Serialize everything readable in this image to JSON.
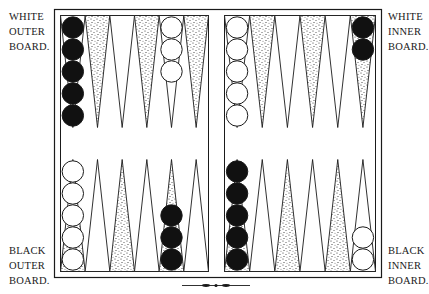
{
  "labels": {
    "white_outer": [
      "WHITE",
      "OUTER",
      "BOARD."
    ],
    "white_inner": [
      "WHITE",
      "INNER",
      "BOARD."
    ],
    "black_outer": [
      "BLACK",
      "OUTER",
      "BOARD."
    ],
    "black_inner": [
      "BLACK",
      "INNER",
      "BOARD."
    ]
  },
  "colors": {
    "line": "#1a1a1a",
    "black_checker": "#111111",
    "white_checker": "#ffffff",
    "stipple": "#2a2a2a",
    "background": "#ffffff"
  },
  "board": {
    "quadrants": {
      "top_left": [
        {
          "stippled": false,
          "checkers": {
            "color": "black",
            "count": 5
          }
        },
        {
          "stippled": true,
          "checkers": null
        },
        {
          "stippled": false,
          "checkers": null
        },
        {
          "stippled": true,
          "checkers": null
        },
        {
          "stippled": false,
          "checkers": {
            "color": "white",
            "count": 3
          }
        },
        {
          "stippled": true,
          "checkers": null
        }
      ],
      "top_right": [
        {
          "stippled": false,
          "checkers": {
            "color": "white",
            "count": 5
          }
        },
        {
          "stippled": true,
          "checkers": null
        },
        {
          "stippled": false,
          "checkers": null
        },
        {
          "stippled": true,
          "checkers": null
        },
        {
          "stippled": false,
          "checkers": null
        },
        {
          "stippled": true,
          "checkers": {
            "color": "black",
            "count": 2
          }
        }
      ],
      "bottom_left": [
        {
          "stippled": true,
          "checkers": {
            "color": "white",
            "count": 5
          }
        },
        {
          "stippled": false,
          "checkers": null
        },
        {
          "stippled": true,
          "checkers": null
        },
        {
          "stippled": false,
          "checkers": null
        },
        {
          "stippled": true,
          "checkers": {
            "color": "black",
            "count": 3
          }
        },
        {
          "stippled": false,
          "checkers": null
        }
      ],
      "bottom_right": [
        {
          "stippled": true,
          "checkers": {
            "color": "black",
            "count": 5
          }
        },
        {
          "stippled": false,
          "checkers": null
        },
        {
          "stippled": true,
          "checkers": null
        },
        {
          "stippled": false,
          "checkers": null
        },
        {
          "stippled": true,
          "checkers": null
        },
        {
          "stippled": false,
          "checkers": {
            "color": "white",
            "count": 2
          }
        }
      ]
    }
  }
}
